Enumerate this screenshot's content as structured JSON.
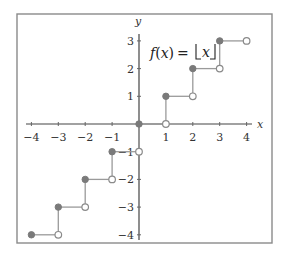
{
  "chart_data": {
    "type": "line",
    "subtype": "step-function",
    "title": "",
    "annotation": "f(x) = ⌊x⌋",
    "annotation_parts": {
      "f": "f",
      "open_paren": "(",
      "x_arg": "x",
      "close_paren": ")",
      "equals": "=",
      "x_floor": "x"
    },
    "xlabel": "x",
    "ylabel": "y",
    "xlim": [
      -4.3,
      4.4
    ],
    "ylim": [
      -4.2,
      3.4
    ],
    "grid": false,
    "legend": null,
    "x_ticks": [
      -4,
      -3,
      -2,
      -1,
      1,
      2,
      3,
      4
    ],
    "x_tick_labels": [
      "−4",
      "−3",
      "−2",
      "−1",
      "1",
      "2",
      "3",
      "4"
    ],
    "y_ticks": [
      3,
      2,
      1,
      -1,
      -2,
      -3,
      -4
    ],
    "y_tick_labels": [
      "3",
      "2",
      "1",
      "−1",
      "−2",
      "−3",
      "−4"
    ],
    "segments": [
      {
        "x_start": -4,
        "x_end": -3,
        "y": -4
      },
      {
        "x_start": -3,
        "x_end": -2,
        "y": -3
      },
      {
        "x_start": -2,
        "x_end": -1,
        "y": -2
      },
      {
        "x_start": -1,
        "x_end": 0,
        "y": -1
      },
      {
        "x_start": 0,
        "x_end": 1,
        "y": 0
      },
      {
        "x_start": 1,
        "x_end": 2,
        "y": 1
      },
      {
        "x_start": 2,
        "x_end": 3,
        "y": 2
      },
      {
        "x_start": 3,
        "x_end": 4,
        "y": 3
      }
    ],
    "closed_points": [
      [
        -4,
        -4
      ],
      [
        -3,
        -3
      ],
      [
        -2,
        -2
      ],
      [
        -1,
        -1
      ],
      [
        0,
        0
      ],
      [
        1,
        1
      ],
      [
        2,
        2
      ],
      [
        3,
        3
      ]
    ],
    "open_points": [
      [
        -3,
        -4
      ],
      [
        -2,
        -3
      ],
      [
        -1,
        -2
      ],
      [
        0,
        -1
      ],
      [
        1,
        0
      ],
      [
        2,
        1
      ],
      [
        3,
        2
      ],
      [
        4,
        3
      ]
    ],
    "colors": {
      "step_line": "#9a9a9a",
      "closed_dot": "#7a7a7a",
      "open_dot_stroke": "#8a8a8a",
      "axis": "#444444",
      "frame": "#8a8a8a"
    }
  }
}
